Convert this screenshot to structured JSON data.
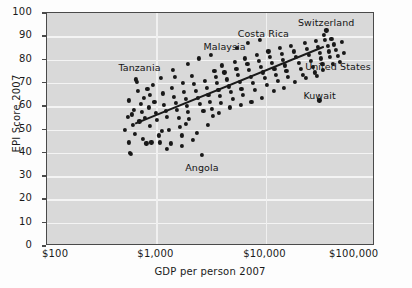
{
  "chart_data": {
    "type": "scatter",
    "title": "",
    "xlabel": "GDP per person 2007",
    "ylabel": "EPI Score 2007",
    "xscale": "log",
    "xlim": [
      100,
      100000
    ],
    "ylim": [
      0,
      100
    ],
    "grid": true,
    "legend": "none",
    "xticks": [
      "$100",
      "$1,000",
      "$10,000",
      "$100,000"
    ],
    "xtick_values": [
      100,
      1000,
      10000,
      100000
    ],
    "yticks": [
      "0",
      "10",
      "20",
      "30",
      "40",
      "50",
      "60",
      "70",
      "80",
      "90",
      "100"
    ],
    "ytick_values": [
      0,
      10,
      20,
      30,
      40,
      50,
      60,
      70,
      80,
      90,
      100
    ],
    "trendline": {
      "type": "linear-fit-on-log-x",
      "x_start": 640,
      "y_start": 52.5,
      "x_end": 34000,
      "y_end": 85.5
    },
    "annotations": [
      {
        "label": "Tanzania",
        "x": 700,
        "y": 76.5
      },
      {
        "label": "Malaysia",
        "x": 4200,
        "y": 85.5
      },
      {
        "label": "Costa Rica",
        "x": 9500,
        "y": 91.0
      },
      {
        "label": "Switzerland",
        "x": 36000,
        "y": 95.5
      },
      {
        "label": "United States",
        "x": 46000,
        "y": 77.0
      },
      {
        "label": "Kuwait",
        "x": 31000,
        "y": 64.5
      },
      {
        "label": "Angola",
        "x": 2600,
        "y": 33.5
      }
    ],
    "points": [
      [
        520,
        50.0
      ],
      [
        545,
        55.5
      ],
      [
        560,
        62.5
      ],
      [
        565,
        44.5
      ],
      [
        575,
        40.0
      ],
      [
        590,
        39.5
      ],
      [
        600,
        56.5
      ],
      [
        615,
        52.0
      ],
      [
        640,
        48.0
      ],
      [
        650,
        71.5
      ],
      [
        660,
        70.5
      ],
      [
        680,
        66.5
      ],
      [
        700,
        53.5
      ],
      [
        720,
        61.0
      ],
      [
        735,
        57.5
      ],
      [
        750,
        46.0
      ],
      [
        770,
        63.5
      ],
      [
        790,
        55.0
      ],
      [
        810,
        44.0
      ],
      [
        830,
        67.5
      ],
      [
        850,
        59.5
      ],
      [
        870,
        51.5
      ],
      [
        900,
        44.5
      ],
      [
        930,
        69.0
      ],
      [
        960,
        62.0
      ],
      [
        990,
        57.0
      ],
      [
        1020,
        54.0
      ],
      [
        1050,
        47.5
      ],
      [
        1080,
        44.5
      ],
      [
        1100,
        72.0
      ],
      [
        1150,
        65.5
      ],
      [
        1180,
        60.5
      ],
      [
        1220,
        58.0
      ],
      [
        1260,
        55.5
      ],
      [
        1300,
        50.0
      ],
      [
        1350,
        44.0
      ],
      [
        1400,
        68.0
      ],
      [
        1450,
        64.0
      ],
      [
        1500,
        61.5
      ],
      [
        1550,
        58.5
      ],
      [
        1600,
        55.0
      ],
      [
        1650,
        51.0
      ],
      [
        1700,
        47.5
      ],
      [
        1750,
        70.0
      ],
      [
        1800,
        66.0
      ],
      [
        1850,
        63.0
      ],
      [
        1900,
        60.0
      ],
      [
        1950,
        57.5
      ],
      [
        2000,
        54.5
      ],
      [
        2100,
        73.0
      ],
      [
        2200,
        69.5
      ],
      [
        2300,
        66.5
      ],
      [
        2400,
        63.5
      ],
      [
        2500,
        61.0
      ],
      [
        2600,
        39.0
      ],
      [
        2700,
        58.0
      ],
      [
        2800,
        71.0
      ],
      [
        2900,
        68.0
      ],
      [
        3000,
        65.0
      ],
      [
        3100,
        62.0
      ],
      [
        3200,
        59.0
      ],
      [
        3300,
        56.0
      ],
      [
        3400,
        75.0
      ],
      [
        3500,
        72.5
      ],
      [
        3600,
        70.0
      ],
      [
        3700,
        67.0
      ],
      [
        3800,
        64.5
      ],
      [
        3900,
        61.5
      ],
      [
        4000,
        77.5
      ],
      [
        4200,
        74.5
      ],
      [
        4400,
        71.5
      ],
      [
        4600,
        68.5
      ],
      [
        4800,
        66.0
      ],
      [
        5000,
        63.0
      ],
      [
        5200,
        79.0
      ],
      [
        5400,
        76.0
      ],
      [
        5600,
        73.5
      ],
      [
        5800,
        70.5
      ],
      [
        6000,
        67.5
      ],
      [
        6200,
        65.0
      ],
      [
        6500,
        80.5
      ],
      [
        6800,
        78.0
      ],
      [
        7000,
        75.5
      ],
      [
        7300,
        72.5
      ],
      [
        7600,
        70.0
      ],
      [
        8000,
        67.0
      ],
      [
        8300,
        82.0
      ],
      [
        8700,
        79.5
      ],
      [
        9000,
        77.0
      ],
      [
        9400,
        74.5
      ],
      [
        9800,
        72.0
      ],
      [
        10200,
        69.0
      ],
      [
        10600,
        83.5
      ],
      [
        11000,
        81.0
      ],
      [
        11500,
        78.5
      ],
      [
        12000,
        76.0
      ],
      [
        12500,
        73.5
      ],
      [
        13000,
        71.0
      ],
      [
        13500,
        85.0
      ],
      [
        14000,
        82.5
      ],
      [
        14500,
        80.0
      ],
      [
        15000,
        77.5
      ],
      [
        15500,
        75.0
      ],
      [
        16000,
        72.5
      ],
      [
        17000,
        86.0
      ],
      [
        18000,
        83.5
      ],
      [
        19000,
        81.0
      ],
      [
        20000,
        78.5
      ],
      [
        21000,
        76.0
      ],
      [
        22000,
        73.5
      ],
      [
        23000,
        87.0
      ],
      [
        24000,
        84.5
      ],
      [
        25000,
        82.0
      ],
      [
        26000,
        79.5
      ],
      [
        27000,
        77.0
      ],
      [
        28000,
        74.5
      ],
      [
        29000,
        88.0
      ],
      [
        30000,
        85.5
      ],
      [
        31000,
        62.5
      ],
      [
        31500,
        83.0
      ],
      [
        32000,
        80.5
      ],
      [
        33000,
        78.0
      ],
      [
        34000,
        90.5
      ],
      [
        35000,
        88.5
      ],
      [
        36000,
        92.5
      ],
      [
        37000,
        86.0
      ],
      [
        38000,
        83.5
      ],
      [
        39000,
        81.0
      ],
      [
        40000,
        89.0
      ],
      [
        42000,
        86.5
      ],
      [
        44000,
        84.0
      ],
      [
        46000,
        81.5
      ],
      [
        48000,
        79.0
      ],
      [
        50000,
        87.5
      ],
      [
        620,
        58.5
      ],
      [
        880,
        65.0
      ],
      [
        1130,
        49.5
      ],
      [
        1480,
        72.5
      ],
      [
        1880,
        52.5
      ],
      [
        2350,
        48.5
      ],
      [
        2950,
        52.0
      ],
      [
        3750,
        57.0
      ],
      [
        4700,
        59.5
      ],
      [
        5900,
        60.5
      ],
      [
        7400,
        62.0
      ],
      [
        9200,
        63.5
      ],
      [
        11800,
        66.5
      ],
      [
        14800,
        68.0
      ],
      [
        18500,
        70.5
      ],
      [
        23500,
        72.0
      ],
      [
        29500,
        73.0
      ],
      [
        33500,
        75.5
      ],
      [
        41000,
        78.0
      ],
      [
        52000,
        83.0
      ],
      [
        1250,
        41.5
      ],
      [
        1700,
        43.0
      ],
      [
        2150,
        45.5
      ],
      [
        5500,
        85.0
      ],
      [
        6900,
        87.0
      ],
      [
        8800,
        88.5
      ],
      [
        2450,
        80.5
      ],
      [
        3150,
        82.0
      ],
      [
        1950,
        78.0
      ],
      [
        1420,
        75.5
      ]
    ]
  },
  "colors": {
    "plot_background": "#d9d9d9",
    "gridline": "#f4f4f4",
    "point": "#181818",
    "axis": "#4a4a4a",
    "text": "#1a1a1a"
  }
}
